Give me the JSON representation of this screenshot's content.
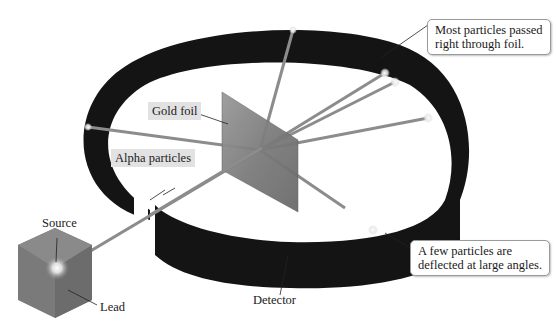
{
  "figure": {
    "colors": {
      "detector": "#141414",
      "foil": "#8a8a8a",
      "beam": "#8c8c8c",
      "lead": "#7a7a7a",
      "label_bg": "#e2e2e2"
    }
  },
  "labels": {
    "source": "Source",
    "lead": "Lead",
    "alpha_particles": "Alpha particles",
    "gold_foil": "Gold foil",
    "detector": "Detector"
  },
  "callouts": {
    "most_particles": {
      "line1": "Most particles passed",
      "line2": "right through foil."
    },
    "few_particles": {
      "line1": "A few particles are",
      "line2": "deflected at large angles."
    }
  }
}
